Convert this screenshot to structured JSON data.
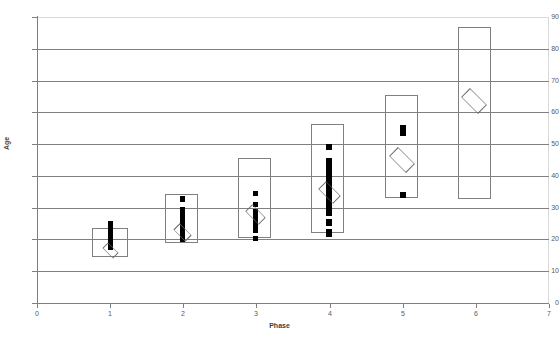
{
  "chart_data": {
    "type": "box",
    "title": "",
    "xlabel": "Phase",
    "ylabel": "Age",
    "xlim": [
      0,
      7
    ],
    "ylim": [
      0,
      90
    ],
    "x_ticks": [
      0,
      1,
      2,
      3,
      4,
      5,
      6,
      7
    ],
    "y_ticks": [
      0,
      10,
      20,
      30,
      40,
      50,
      60,
      70,
      80,
      90
    ],
    "grid": "horizontal",
    "legend": "none",
    "categories": [
      "1",
      "2",
      "3",
      "4",
      "5",
      "6"
    ],
    "series": [
      {
        "name": "Age by Phase",
        "boxes": [
          {
            "phase": 1,
            "box_low": 14.5,
            "box_high": 23.5,
            "whisker_low": 19.0,
            "whisker_high": 27.0,
            "mean": 21.0
          },
          {
            "phase": 2,
            "box_low": 19.0,
            "box_high": 34.0,
            "whisker_low": 21.0,
            "whisker_high": 31.5,
            "mean": 23.0
          },
          {
            "phase": 3,
            "box_low": 20.5,
            "box_high": 45.5,
            "whisker_low": 23.0,
            "whisker_high": 36.5,
            "mean": 28.0
          },
          {
            "phase": 4,
            "box_low": 22.5,
            "box_high": 56.5,
            "whisker_low": 24.0,
            "whisker_high": 50.0,
            "mean": 35.5
          },
          {
            "phase": 5,
            "box_low": 33.0,
            "box_high": 65.5,
            "whisker_low": 36.0,
            "whisker_high": 53.0,
            "mean": 45.0
          },
          {
            "phase": 6,
            "box_low": 34.5,
            "box_high": 86.5,
            "whisker_low": 62.0,
            "whisker_high": 62.0,
            "mean": 62.0
          }
        ]
      }
    ],
    "y_tick_labels": [
      "0",
      "10",
      "20",
      "30",
      "40",
      "50",
      "60",
      "70",
      "80",
      "90"
    ],
    "x_tick_labels": [
      "0",
      "1",
      "2",
      "3",
      "4",
      "5",
      "6",
      "7"
    ],
    "marker_mean": "open-diamond",
    "marker_data": "filled-square",
    "colors": {
      "box_stroke": "#808080",
      "data_marker": "#000000",
      "mean_marker": "#6b6b6b",
      "gridline": "#808080",
      "axis": "#7f7f7f",
      "text": "#5a5a5a",
      "background": "#ffffff"
    }
  },
  "geometry": {
    "plot_left": 37,
    "plot_right": 549,
    "plot_top": 17,
    "plot_bottom": 303,
    "px_per_x": 73.14,
    "px_per_y": 3.1778
  },
  "glyphs": {
    "phase1": {
      "box": {
        "x": 92,
        "y": 228,
        "w": 36,
        "h": 29
      },
      "dots": [
        {
          "x": 108,
          "y": 221,
          "w": 5,
          "h": 7
        },
        {
          "x": 108,
          "y": 228,
          "w": 5,
          "h": 22
        }
      ],
      "diamond": {
        "cx": 110,
        "cy": 250,
        "size": 15
      }
    },
    "phase2": {
      "box": {
        "x": 165,
        "y": 194,
        "w": 33,
        "h": 49
      },
      "dots": [
        {
          "x": 180,
          "y": 196,
          "w": 5,
          "h": 6
        },
        {
          "x": 180,
          "y": 207,
          "w": 5,
          "h": 35
        }
      ],
      "diamond": {
        "cx": 182,
        "cy": 232,
        "size": 17
      }
    },
    "phase3": {
      "box": {
        "x": 238,
        "y": 158,
        "w": 33,
        "h": 80
      },
      "dots": [
        {
          "x": 253,
          "y": 191,
          "w": 5,
          "h": 5
        },
        {
          "x": 253,
          "y": 202,
          "w": 5,
          "h": 5
        },
        {
          "x": 253,
          "y": 209,
          "w": 5,
          "h": 24
        },
        {
          "x": 253,
          "y": 236,
          "w": 5,
          "h": 5
        }
      ],
      "diamond": {
        "cx": 255,
        "cy": 214,
        "size": 19
      }
    },
    "phase4": {
      "box": {
        "x": 311,
        "y": 124,
        "w": 33,
        "h": 109
      },
      "dots": [
        {
          "x": 326,
          "y": 144,
          "w": 6,
          "h": 6
        },
        {
          "x": 326,
          "y": 158,
          "w": 6,
          "h": 58
        },
        {
          "x": 326,
          "y": 219,
          "w": 6,
          "h": 7
        },
        {
          "x": 326,
          "y": 229,
          "w": 6,
          "h": 8
        }
      ],
      "diamond": {
        "cx": 329,
        "cy": 192,
        "size": 21
      }
    },
    "phase5": {
      "box": {
        "x": 385,
        "y": 95,
        "w": 33,
        "h": 103
      },
      "dots": [
        {
          "x": 400,
          "y": 125,
          "w": 6,
          "h": 11
        },
        {
          "x": 400,
          "y": 192,
          "w": 6,
          "h": 6
        }
      ],
      "diamond": {
        "cx": 402,
        "cy": 160,
        "size": 24
      }
    },
    "phase6": {
      "box": {
        "x": 458,
        "y": 27,
        "w": 33,
        "h": 172
      },
      "dots": [],
      "diamond": {
        "cx": 474,
        "cy": 101,
        "size": 24
      }
    }
  }
}
